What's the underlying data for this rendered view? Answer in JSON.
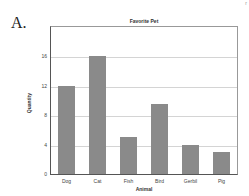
{
  "panel_label": "A.",
  "corner_mark": "r",
  "chart_data": {
    "type": "bar",
    "title": "Favorite Pet",
    "xlabel": "Animal",
    "ylabel": "Quantity",
    "categories": [
      "Dog",
      "Cat",
      "Fish",
      "Bird",
      "Gerbil",
      "Pig"
    ],
    "values": [
      12,
      16,
      5,
      9.5,
      4,
      3
    ],
    "ylim": [
      0,
      20
    ],
    "yticks": [
      0,
      4,
      8,
      12,
      16
    ],
    "grid": true,
    "bar_color": "#8a8a8a",
    "legend": null
  }
}
